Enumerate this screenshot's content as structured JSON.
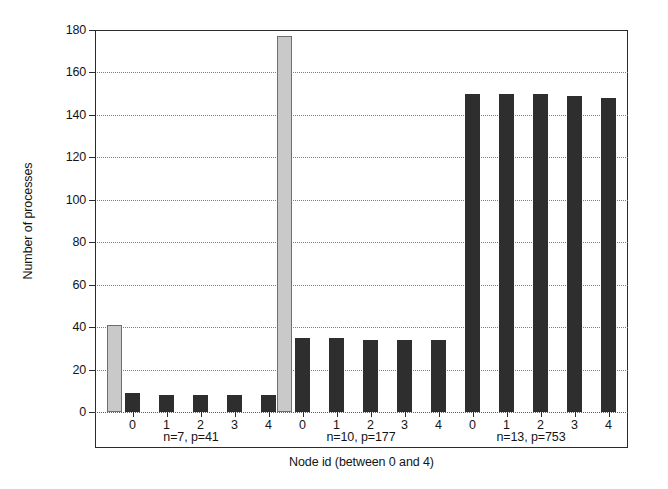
{
  "chart_data": {
    "type": "bar",
    "title": "",
    "subtitle": "",
    "xlabel": "Node id (between 0 and 4)",
    "ylabel": "Number of processes",
    "ylim": [
      0,
      180
    ],
    "ytick_values": [
      0,
      20,
      40,
      60,
      80,
      100,
      120,
      140,
      160,
      180
    ],
    "ytick_labels": [
      "0",
      "20",
      "40",
      "60",
      "80",
      "100",
      "120",
      "140",
      "160",
      "180"
    ],
    "ytick_step": 20,
    "grid": "horizontal-dotted",
    "legend": "none",
    "legend_position": "none",
    "categories": [
      "0",
      "1",
      "2",
      "3",
      "4"
    ],
    "colors": {
      "total_bar": "#c9c9c9",
      "node_bar": "#2e2e2e",
      "axis": "#2b2b2b",
      "gridline": "#7d7d7d",
      "background": "#ffffff"
    },
    "groups": [
      {
        "id": "g1",
        "label": "n=7, p=41",
        "n": 7,
        "p": 41,
        "total_bar": {
          "label": "total",
          "value": 41,
          "shown": true
        },
        "xtick_labels": [
          "0",
          "1",
          "2",
          "3",
          "4"
        ],
        "values": [
          9,
          8,
          8,
          8,
          8
        ]
      },
      {
        "id": "g2",
        "label": "n=10, p=177",
        "n": 10,
        "p": 177,
        "total_bar": {
          "label": "total",
          "value": 177,
          "shown": true
        },
        "xtick_labels": [
          "0",
          "1",
          "2",
          "3",
          "4"
        ],
        "values": [
          35,
          35,
          34,
          34,
          34
        ]
      },
      {
        "id": "g3",
        "label": "n=13, p=753",
        "n": 13,
        "p": 753,
        "total_bar": {
          "label": "total",
          "value": 753,
          "shown": false
        },
        "xtick_labels": [
          "0",
          "1",
          "2",
          "3",
          "4"
        ],
        "values": [
          150,
          150,
          150,
          149,
          148
        ]
      }
    ]
  }
}
